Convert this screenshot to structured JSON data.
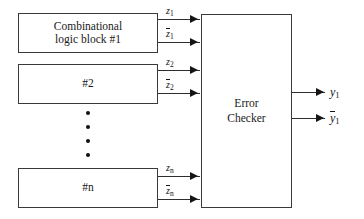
{
  "diagram": {
    "type": "block-diagram",
    "canvas": {
      "width": 364,
      "height": 219
    },
    "colors": {
      "stroke": "#3a3a3a",
      "wire": "#2e2e2e",
      "text": "#1a1a1a",
      "background": "#ffffff"
    }
  },
  "blocks": {
    "block1": {
      "line1": "Combinational",
      "line2": "logic block #1"
    },
    "block2": {
      "label": "#2"
    },
    "blockn": {
      "label": "#n"
    },
    "checker": {
      "line1": "Error",
      "line2": "Checker"
    }
  },
  "ellipsis": {
    "dot_count": 4
  },
  "signals": {
    "inputs": [
      {
        "base": "z",
        "sub": "1",
        "complement": false
      },
      {
        "base": "z",
        "sub": "1",
        "complement": true
      },
      {
        "base": "z",
        "sub": "2",
        "complement": false
      },
      {
        "base": "z",
        "sub": "2",
        "complement": true
      },
      {
        "base": "z",
        "sub": "n",
        "complement": false
      },
      {
        "base": "z",
        "sub": "n",
        "complement": true
      }
    ],
    "outputs": [
      {
        "base": "y",
        "sub": "1",
        "complement": false
      },
      {
        "base": "y",
        "sub": "1",
        "complement": true
      }
    ]
  },
  "labels": {
    "z1": "z",
    "z1_sub": "1",
    "z1b": "z",
    "z1b_sub": "1",
    "z2": "z",
    "z2_sub": "2",
    "z2b": "z",
    "z2b_sub": "2",
    "zn": "z",
    "zn_sub": "n",
    "znb": "z",
    "znb_sub": "n",
    "y1": "y",
    "y1_sub": "1",
    "y1b": "y",
    "y1b_sub": "1"
  }
}
